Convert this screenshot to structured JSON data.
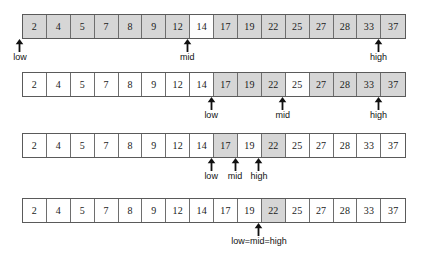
{
  "diagram": {
    "array_values": [
      2,
      4,
      5,
      7,
      8,
      9,
      12,
      14,
      17,
      19,
      22,
      25,
      27,
      28,
      33,
      37
    ],
    "colors": {
      "shaded_cell": "#d6d6d6",
      "plain_cell": "#ffffff",
      "border": "#5a5a5a",
      "text": "#1a1a1a",
      "background": "#ffffff"
    },
    "steps": [
      {
        "id": "step-1",
        "cells": [
          {
            "value": "2",
            "state": "shaded"
          },
          {
            "value": "4",
            "state": "shaded"
          },
          {
            "value": "5",
            "state": "shaded"
          },
          {
            "value": "7",
            "state": "shaded"
          },
          {
            "value": "8",
            "state": "shaded"
          },
          {
            "value": "9",
            "state": "shaded"
          },
          {
            "value": "12",
            "state": "shaded"
          },
          {
            "value": "14",
            "state": "highlight"
          },
          {
            "value": "17",
            "state": "shaded"
          },
          {
            "value": "19",
            "state": "shaded"
          },
          {
            "value": "22",
            "state": "shaded"
          },
          {
            "value": "25",
            "state": "shaded"
          },
          {
            "value": "27",
            "state": "shaded"
          },
          {
            "value": "28",
            "state": "shaded"
          },
          {
            "value": "33",
            "state": "shaded"
          },
          {
            "value": "37",
            "state": "shaded"
          }
        ],
        "markers": [
          {
            "label": "low",
            "index": 0
          },
          {
            "label": "mid",
            "index": 7
          },
          {
            "label": "high",
            "index": 15
          }
        ]
      },
      {
        "id": "step-2",
        "cells": [
          {
            "value": "2",
            "state": "plain"
          },
          {
            "value": "4",
            "state": "plain"
          },
          {
            "value": "5",
            "state": "plain"
          },
          {
            "value": "7",
            "state": "plain"
          },
          {
            "value": "8",
            "state": "plain"
          },
          {
            "value": "9",
            "state": "plain"
          },
          {
            "value": "12",
            "state": "plain"
          },
          {
            "value": "14",
            "state": "plain"
          },
          {
            "value": "17",
            "state": "shaded"
          },
          {
            "value": "19",
            "state": "shaded"
          },
          {
            "value": "22",
            "state": "shaded"
          },
          {
            "value": "25",
            "state": "highlight"
          },
          {
            "value": "27",
            "state": "shaded"
          },
          {
            "value": "28",
            "state": "shaded"
          },
          {
            "value": "33",
            "state": "shaded"
          },
          {
            "value": "37",
            "state": "shaded"
          }
        ],
        "markers": [
          {
            "label": "low",
            "index": 8
          },
          {
            "label": "mid",
            "index": 11
          },
          {
            "label": "high",
            "index": 15
          }
        ]
      },
      {
        "id": "step-3",
        "cells": [
          {
            "value": "2",
            "state": "plain"
          },
          {
            "value": "4",
            "state": "plain"
          },
          {
            "value": "5",
            "state": "plain"
          },
          {
            "value": "7",
            "state": "plain"
          },
          {
            "value": "8",
            "state": "plain"
          },
          {
            "value": "9",
            "state": "plain"
          },
          {
            "value": "12",
            "state": "plain"
          },
          {
            "value": "14",
            "state": "plain"
          },
          {
            "value": "17",
            "state": "shaded"
          },
          {
            "value": "19",
            "state": "highlight"
          },
          {
            "value": "22",
            "state": "shaded"
          },
          {
            "value": "25",
            "state": "plain"
          },
          {
            "value": "27",
            "state": "plain"
          },
          {
            "value": "28",
            "state": "plain"
          },
          {
            "value": "33",
            "state": "plain"
          },
          {
            "value": "37",
            "state": "plain"
          }
        ],
        "markers": [
          {
            "label": "low",
            "index": 8
          },
          {
            "label": "mid",
            "index": 9
          },
          {
            "label": "high",
            "index": 10
          }
        ]
      },
      {
        "id": "step-4",
        "cells": [
          {
            "value": "2",
            "state": "plain"
          },
          {
            "value": "4",
            "state": "plain"
          },
          {
            "value": "5",
            "state": "plain"
          },
          {
            "value": "7",
            "state": "plain"
          },
          {
            "value": "8",
            "state": "plain"
          },
          {
            "value": "9",
            "state": "plain"
          },
          {
            "value": "12",
            "state": "plain"
          },
          {
            "value": "14",
            "state": "plain"
          },
          {
            "value": "17",
            "state": "plain"
          },
          {
            "value": "19",
            "state": "plain"
          },
          {
            "value": "22",
            "state": "shaded"
          },
          {
            "value": "25",
            "state": "plain"
          },
          {
            "value": "27",
            "state": "plain"
          },
          {
            "value": "28",
            "state": "plain"
          },
          {
            "value": "33",
            "state": "plain"
          },
          {
            "value": "37",
            "state": "plain"
          }
        ],
        "markers": [
          {
            "label": "low=mid=high",
            "index": 10
          }
        ]
      }
    ]
  }
}
